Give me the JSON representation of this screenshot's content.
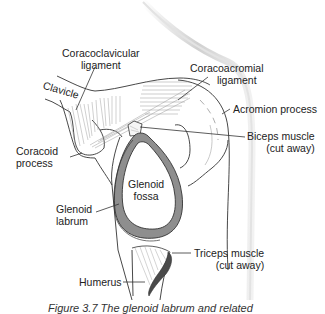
{
  "figure": {
    "caption": "Figure 3.7   The glenoid labrum and related",
    "colors": {
      "outline": "#333333",
      "labrum": "#8a8a8a",
      "triceps": "#4a4a4a",
      "skin_shadow": "#d8d8d8",
      "ligament_fiber": "#9a9a9a"
    }
  },
  "labels": {
    "coracoclavicular": [
      "Coracoclavicular",
      "ligament"
    ],
    "coracoacromial": [
      "Coracoacromial",
      "ligament"
    ],
    "clavicle": "Clavicle",
    "acromion": "Acromion process",
    "biceps": [
      "Biceps muscle",
      "(cut away)"
    ],
    "coracoid": [
      "Coracoid",
      "process"
    ],
    "glenoid_fossa": [
      "Glenoid",
      "fossa"
    ],
    "glenoid_labrum": [
      "Glenoid",
      "labrum"
    ],
    "triceps": [
      "Triceps muscle",
      "(cut away)"
    ],
    "humerus": "Humerus"
  }
}
